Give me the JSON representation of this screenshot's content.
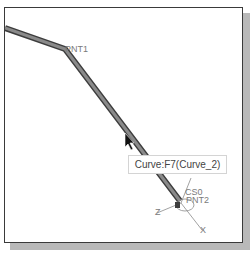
{
  "viewport": {
    "point_labels": {
      "pnt1": "PNT1",
      "pnt2": "PNT2",
      "csys": "CS0"
    },
    "axis_labels": {
      "x": "X",
      "z": "Z"
    },
    "tooltip": "Curve:F7(Curve_2)",
    "colors": {
      "curve": "#6f6f6f",
      "curve_edge": "#3d3d3d",
      "frame": "#3a3a3a",
      "shadow": "#b9b9b9"
    }
  }
}
